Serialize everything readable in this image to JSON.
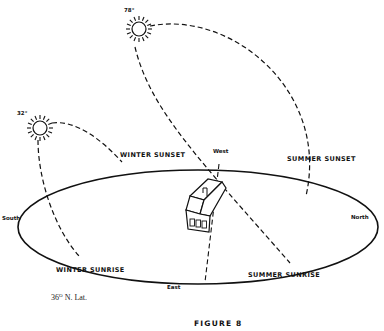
{
  "figure": {
    "caption": "FIGURE 8",
    "latitude_note": {
      "value": "36",
      "degree": "O",
      "suffix": " N. Lat."
    }
  },
  "suns": [
    {
      "name": "summer-sun",
      "altitude_label": "78°"
    },
    {
      "name": "winter-sun",
      "altitude_label": "32°"
    }
  ],
  "directions": {
    "north": "North",
    "south": "South",
    "east": "East",
    "west": "West"
  },
  "events": {
    "winter_sunset": "WINTER SUNSET",
    "winter_sunrise": "WINTER SUNRISE",
    "summer_sunset": "SUMMER SUNSET",
    "summer_sunrise": "SUMMER SUNRISE"
  },
  "colors": {
    "ink": "#111111",
    "background": "#ffffff"
  }
}
